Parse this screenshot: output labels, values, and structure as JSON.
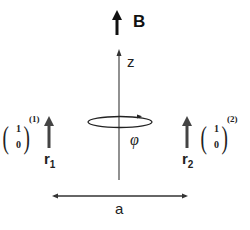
{
  "field": {
    "label": "B"
  },
  "axis": {
    "label": "z"
  },
  "rotation": {
    "label": "φ"
  },
  "spin1": {
    "label": "r",
    "subscript": "1",
    "vector_top": "1",
    "vector_bottom": "0",
    "superscript": "(1)"
  },
  "spin2": {
    "label": "r",
    "subscript": "2",
    "vector_top": "1",
    "vector_bottom": "0",
    "superscript": "(2)"
  },
  "distance": {
    "label": "a"
  },
  "colors": {
    "stroke": "#222222",
    "axis": "#555555"
  }
}
